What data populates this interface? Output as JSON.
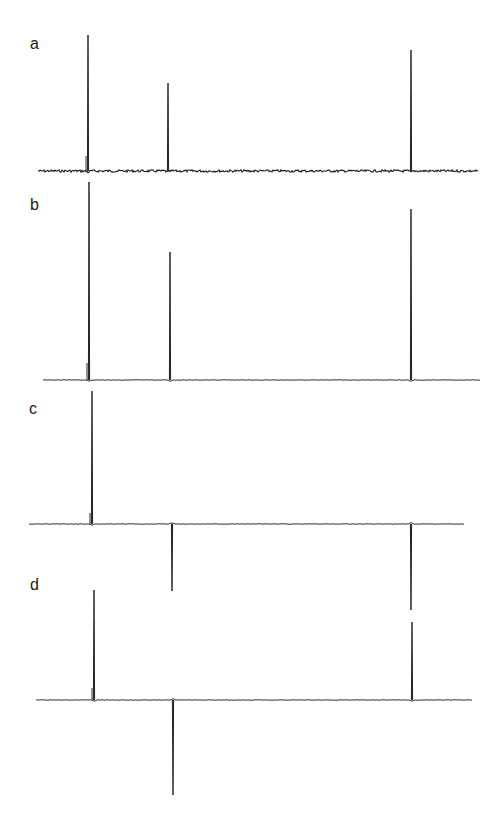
{
  "chart_data": {
    "type": "line",
    "title": "",
    "xlabel": "",
    "ylabel": "",
    "grid": false,
    "legend": null,
    "panels": [
      {
        "label": "a",
        "noisy": true,
        "baseline_y": 171,
        "x_range": [
          38,
          478
        ],
        "peaks": [
          {
            "x": 88,
            "top": 35,
            "sign": 1,
            "shoulder": {
              "x": 86,
              "top": 156
            }
          },
          {
            "x": 168,
            "top": 83,
            "sign": 1
          },
          {
            "x": 411,
            "top": 50,
            "sign": 1
          }
        ]
      },
      {
        "label": "b",
        "noisy": false,
        "baseline_y": 380,
        "x_range": [
          43,
          480
        ],
        "peaks": [
          {
            "x": 89,
            "top": 182,
            "sign": 1,
            "shoulder": {
              "x": 87,
              "top": 363
            }
          },
          {
            "x": 170,
            "top": 252,
            "sign": 1
          },
          {
            "x": 411,
            "top": 209,
            "sign": 1
          }
        ]
      },
      {
        "label": "c",
        "noisy": false,
        "baseline_y": 524,
        "x_range": [
          29,
          464
        ],
        "peaks": [
          {
            "x": 92,
            "top": 391,
            "sign": 1,
            "shoulder": {
              "x": 90,
              "top": 513
            }
          },
          {
            "x": 172,
            "top": 591,
            "sign": -1
          },
          {
            "x": 411,
            "top": 610,
            "sign": -1
          }
        ]
      },
      {
        "label": "d",
        "noisy": false,
        "baseline_y": 700,
        "x_range": [
          36,
          472
        ],
        "peaks": [
          {
            "x": 94,
            "top": 590,
            "sign": 1,
            "shoulder": {
              "x": 92,
              "top": 688
            }
          },
          {
            "x": 173,
            "top": 795,
            "sign": -1
          },
          {
            "x": 412,
            "top": 622,
            "sign": 1
          }
        ]
      }
    ],
    "relative_intensities": {
      "a": [
        1.0,
        0.65,
        0.89
      ],
      "b": [
        1.0,
        0.64,
        0.86
      ],
      "c": [
        1.0,
        -0.5,
        -0.65
      ],
      "d": [
        1.0,
        -0.86,
        0.71
      ]
    }
  },
  "labels": {
    "a": "a",
    "b": "b",
    "c": "c",
    "d": "d"
  },
  "colors": {
    "trace": "#1a1a1a",
    "background": "#ffffff"
  }
}
